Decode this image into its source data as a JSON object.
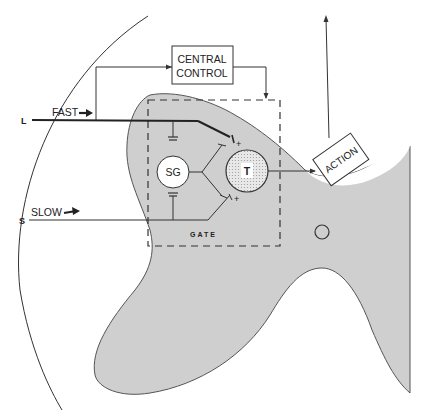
{
  "diagram": {
    "colors": {
      "tissue_fill": "#cfcfcf",
      "line": "#2a2a2a",
      "background": "#ffffff",
      "t_cell_fill": "#dcdcdc"
    },
    "labels": {
      "central_control_line1": "CENTRAL",
      "central_control_line2": "CONTROL",
      "action": "ACTION",
      "fast": "FAST",
      "slow": "SLOW",
      "large_fiber": "L",
      "small_fiber": "S",
      "sg": "SG",
      "t": "T",
      "gate": "GATE",
      "plus": "+",
      "minus": "−"
    }
  }
}
